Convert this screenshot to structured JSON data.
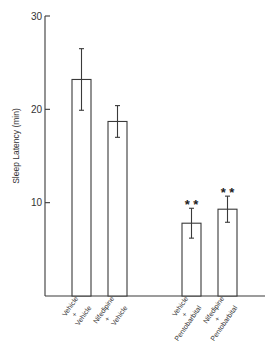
{
  "chart_data": {
    "type": "bar",
    "title": "",
    "xlabel": "",
    "ylabel": "Sleep Latency (min)",
    "ylim": [
      0,
      30
    ],
    "yticks": [
      10,
      20,
      30
    ],
    "grid": false,
    "categories": [
      [
        "Vehicle",
        "+",
        "Vehicle"
      ],
      [
        "Nifedipine",
        "+",
        "Vehicle"
      ],
      [
        "Vehicle",
        "+",
        "Pentobarbital"
      ],
      [
        "Nifedipine",
        "+",
        "Pentobarbital"
      ]
    ],
    "values": [
      23.2,
      18.7,
      7.8,
      9.3
    ],
    "error": [
      3.3,
      1.7,
      1.6,
      1.4
    ],
    "annotations": [
      "",
      "",
      "**",
      "**"
    ]
  }
}
